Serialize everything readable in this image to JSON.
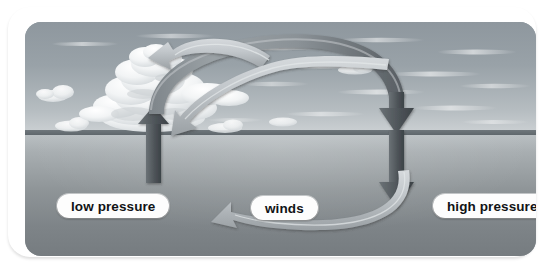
{
  "diagram": {
    "scene": {
      "sky_label": "sky-with-clouds",
      "ground_label": "sea-surface",
      "horizon_label": "horizon-line"
    },
    "labels": {
      "low_pressure": "low pressure",
      "winds": "winds",
      "high_pressure": "high pressure"
    },
    "arrows": {
      "rising": {
        "name": "rising-air-arrow",
        "description": "dark arrow rising from low pressure area upward through cumulus cloud"
      },
      "arc": {
        "name": "upper-air-flow-arc",
        "description": "arc of air flowing aloft from low pressure side to high pressure side"
      },
      "descending": {
        "name": "sinking-air-arrow",
        "description": "dark arrow descending toward the high pressure area"
      },
      "wind_upper": {
        "name": "wind-arrow-upper",
        "description": "surface wind arrow curving left toward low pressure"
      },
      "wind_middle": {
        "name": "wind-arrow-middle",
        "description": "surface wind arrow curving left toward low pressure"
      },
      "wind_lower": {
        "name": "wind-arrow-lower",
        "description": "surface wind arrow curving left toward low pressure"
      }
    },
    "colors": {
      "sky": "#99a2a8",
      "ground": "#8f9598",
      "horizon": "#6f777c",
      "dark_arrow": "#4a5054",
      "light_arrow": "#b9bec1",
      "label_bg": "#fdfdfd",
      "label_text": "#111315",
      "frame": "#ffffff"
    }
  }
}
